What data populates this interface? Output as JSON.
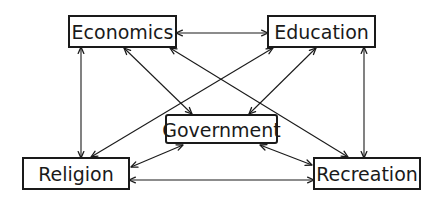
{
  "diagram": {
    "type": "relationship-diagram",
    "nodes": [
      {
        "id": "economics",
        "label": "Economics"
      },
      {
        "id": "education",
        "label": "Education"
      },
      {
        "id": "government",
        "label": "Government"
      },
      {
        "id": "religion",
        "label": "Religion"
      },
      {
        "id": "recreation",
        "label": "Recreation"
      }
    ],
    "edges": [
      {
        "from": "economics",
        "to": "education",
        "direction": "both"
      },
      {
        "from": "economics",
        "to": "religion",
        "direction": "both"
      },
      {
        "from": "education",
        "to": "recreation",
        "direction": "both"
      },
      {
        "from": "religion",
        "to": "recreation",
        "direction": "both"
      },
      {
        "from": "economics",
        "to": "government",
        "direction": "both"
      },
      {
        "from": "education",
        "to": "government",
        "direction": "both"
      },
      {
        "from": "religion",
        "to": "government",
        "direction": "both"
      },
      {
        "from": "recreation",
        "to": "government",
        "direction": "both"
      },
      {
        "from": "economics",
        "to": "recreation",
        "direction": "both"
      },
      {
        "from": "education",
        "to": "religion",
        "direction": "both"
      }
    ]
  }
}
